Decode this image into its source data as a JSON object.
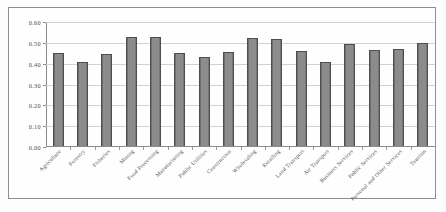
{
  "chart_data": {
    "type": "bar",
    "title": "",
    "subtitle": "",
    "xlabel": "",
    "ylabel": "",
    "ylim": [
      0.0,
      0.6
    ],
    "ytick_labels": [
      "0.60",
      "0.50",
      "0.40",
      "0.30",
      "0.20",
      "0.10",
      "0.00"
    ],
    "ytick_values": [
      0.6,
      0.5,
      0.4,
      0.3,
      0.2,
      0.1,
      0.0
    ],
    "grid": true,
    "legend": "none",
    "bar_color": "#8c8c8c",
    "bar_border_color": "#4f4f4f",
    "categories": [
      "Agriculture",
      "Forestry",
      "Fisheries",
      "Mining",
      "Food Processing",
      "Manufacturing",
      "Public Utilities",
      "Construction",
      "Wholesaling",
      "Retailing",
      "Land Transport",
      "Air Transport",
      "Business Services",
      "Public Services",
      "Personal and Other Services",
      "Tourism"
    ],
    "values": [
      0.445,
      0.402,
      0.443,
      0.525,
      0.525,
      0.445,
      0.427,
      0.45,
      0.52,
      0.515,
      0.455,
      0.405,
      0.488,
      0.46,
      0.465,
      0.495
    ]
  }
}
